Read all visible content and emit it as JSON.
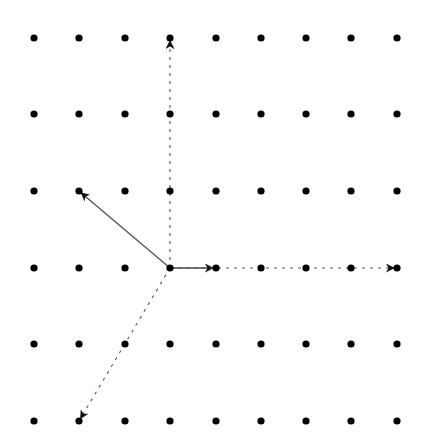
{
  "diagram": {
    "type": "lattice-vectors",
    "grid": {
      "columns": 9,
      "rows": 6,
      "x_positions": [
        34,
        79,
        125,
        170,
        216,
        261,
        306,
        351,
        397
      ],
      "y_positions": [
        38,
        114,
        191,
        268,
        344,
        421
      ],
      "dot_radius": 3.6,
      "dot_color": "#000000"
    },
    "origin": {
      "col": 3,
      "row": 3
    },
    "vectors": [
      {
        "name": "basis-vector-right",
        "from": {
          "col": 3,
          "row": 3
        },
        "to": {
          "col": 4,
          "row": 3
        },
        "style": "solid",
        "color": "#444444"
      },
      {
        "name": "basis-vector-up-left",
        "from": {
          "col": 3,
          "row": 3
        },
        "to": {
          "col": 1,
          "row": 2
        },
        "style": "solid",
        "color": "#555555"
      },
      {
        "name": "lattice-vector-up",
        "from": {
          "col": 3,
          "row": 3
        },
        "to": {
          "col": 3,
          "row": 0
        },
        "style": "dashed",
        "color": "#555555"
      },
      {
        "name": "lattice-vector-right",
        "from": {
          "col": 3,
          "row": 3
        },
        "to": {
          "col": 8,
          "row": 3
        },
        "style": "dashed",
        "color": "#555555"
      },
      {
        "name": "lattice-vector-down-left",
        "from": {
          "col": 3,
          "row": 3
        },
        "to": {
          "col": 1,
          "row": 5
        },
        "style": "dashed",
        "color": "#555555"
      }
    ]
  }
}
